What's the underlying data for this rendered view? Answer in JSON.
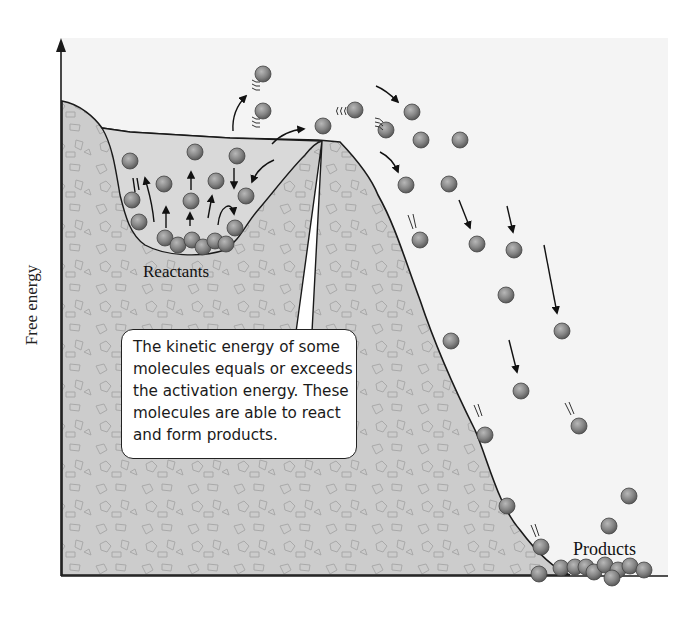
{
  "diagram": {
    "type": "energy-landscape",
    "y_axis_label": "Free energy",
    "labels": {
      "reactants": "Reactants",
      "products": "Products"
    },
    "callout": {
      "lines": [
        "The kinetic energy of some",
        "molecules equals or exceeds",
        "the activation energy. These",
        "molecules are able to react",
        "and form products."
      ]
    },
    "colors": {
      "background": "#f5f5f5",
      "terrain_fill": "#cfcfcf",
      "basin_fill": "#d8d8d8",
      "molecule": "#8a8a8a",
      "line": "#1a1a1a"
    },
    "elements": {
      "molecules_in_basin": 16,
      "molecules_escaping": 3,
      "molecules_falling": 18,
      "molecules_product_pile": 9
    }
  }
}
